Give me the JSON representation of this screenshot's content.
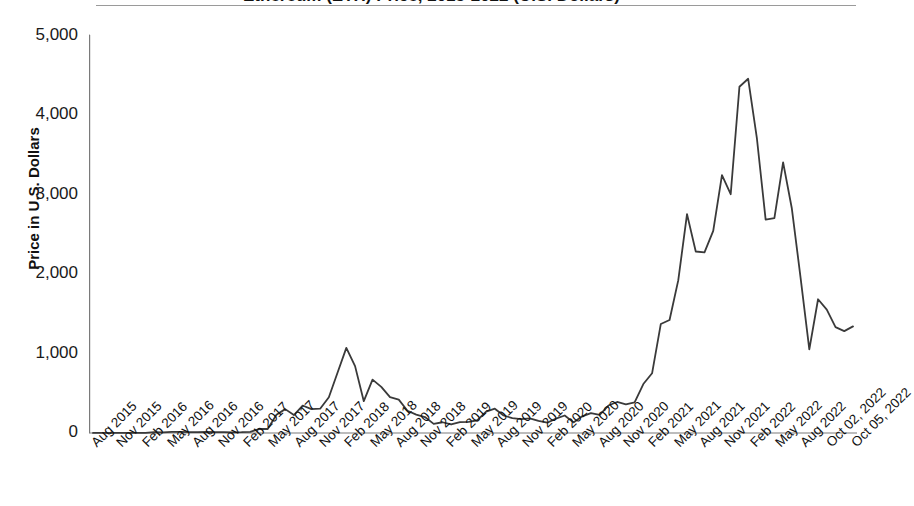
{
  "title": "Ethereum (ETH) Price, 2015-2022 (U.S. Dollars)",
  "axes": {
    "ylabel": "Price in U.S. Dollars",
    "yticks": [
      "5,000",
      "4,000",
      "3,000",
      "2,000",
      "1,000",
      "0"
    ],
    "ytick_values": [
      5000,
      4000,
      3000,
      2000,
      1000,
      0
    ]
  },
  "chart_data": {
    "type": "line",
    "title": "Ethereum (ETH) Price, 2015-2022 (U.S. Dollars)",
    "xlabel": "",
    "ylabel": "Price in U.S. Dollars",
    "ylim": [
      0,
      5000
    ],
    "grid": false,
    "legend": "none",
    "line_color": "#3a3a3a",
    "x_tick_labels": [
      "Aug 2015",
      "Nov 2015",
      "Feb 2016",
      "May 2016",
      "Aug 2016",
      "Nov 2016",
      "Feb 2017",
      "May 2017",
      "Aug 2017",
      "Nov 2017",
      "Feb 2018",
      "May 2018",
      "Aug 2018",
      "Nov 2018",
      "Feb 2019",
      "May 2019",
      "Aug 2019",
      "Nov 2019",
      "Feb 2020",
      "May 2020",
      "Aug 2020",
      "Nov 2020",
      "Feb 2021",
      "May 2021",
      "Aug 2021",
      "Nov 2021",
      "Feb 2022",
      "May 2022",
      "Aug 2022",
      "Oct 02, 2022",
      "Oct 05, 2022"
    ],
    "x": [
      "Aug 2015",
      "Sep 2015",
      "Oct 2015",
      "Nov 2015",
      "Dec 2015",
      "Jan 2016",
      "Feb 2016",
      "Mar 2016",
      "Apr 2016",
      "May 2016",
      "Jun 2016",
      "Jul 2016",
      "Aug 2016",
      "Sep 2016",
      "Oct 2016",
      "Nov 2016",
      "Dec 2016",
      "Jan 2017",
      "Feb 2017",
      "Mar 2017",
      "Apr 2017",
      "May 2017",
      "Jun 2017",
      "Jul 2017",
      "Aug 2017",
      "Sep 2017",
      "Oct 2017",
      "Nov 2017",
      "Dec 2017",
      "Jan 2018",
      "Feb 2018",
      "Mar 2018",
      "Apr 2018",
      "May 2018",
      "Jun 2018",
      "Jul 2018",
      "Aug 2018",
      "Sep 2018",
      "Oct 2018",
      "Nov 2018",
      "Dec 2018",
      "Jan 2019",
      "Feb 2019",
      "Mar 2019",
      "Apr 2019",
      "May 2019",
      "Jun 2019",
      "Jul 2019",
      "Aug 2019",
      "Sep 2019",
      "Oct 2019",
      "Nov 2019",
      "Dec 2019",
      "Jan 2020",
      "Feb 2020",
      "Mar 2020",
      "Apr 2020",
      "May 2020",
      "Jun 2020",
      "Jul 2020",
      "Aug 2020",
      "Sep 2020",
      "Oct 2020",
      "Nov 2020",
      "Dec 2020",
      "Jan 2021",
      "Feb 2021",
      "Mar 2021",
      "Apr 2021",
      "May 2021",
      "Jun 2021",
      "Jul 2021",
      "Aug 2021",
      "Sep 2021",
      "Oct 2021",
      "Nov 2021",
      "Dec 2021",
      "Jan 2022",
      "Feb 2022",
      "Mar 2022",
      "Apr 2022",
      "May 2022",
      "Jun 2022",
      "Jul 2022",
      "Aug 2022",
      "Sep 2022",
      "Oct 02, 2022",
      "Oct 05, 2022"
    ],
    "values": [
      1,
      1,
      1,
      1,
      1,
      1,
      2,
      11,
      8,
      14,
      13,
      12,
      11,
      13,
      12,
      10,
      8,
      10,
      15,
      50,
      50,
      230,
      300,
      225,
      345,
      300,
      305,
      450,
      760,
      1070,
      840,
      400,
      670,
      580,
      450,
      420,
      280,
      230,
      200,
      115,
      135,
      107,
      136,
      141,
      160,
      268,
      305,
      220,
      187,
      175,
      183,
      151,
      129,
      180,
      220,
      133,
      210,
      250,
      228,
      345,
      390,
      360,
      385,
      615,
      750,
      1370,
      1420,
      1920,
      2750,
      2280,
      2270,
      2540,
      3240,
      3000,
      4350,
      4450,
      3700,
      2680,
      2700,
      3400,
      2820,
      1950,
      1050,
      1680,
      1550,
      1330,
      1280,
      1340
    ],
    "notable_points": [
      {
        "label": "2018 bubble peak",
        "x": "Jan 2018",
        "y": 1070
      },
      {
        "label": "all-time high",
        "x": "Nov 2021",
        "y": 4450
      },
      {
        "label": "2022 low",
        "x": "Jun 2022",
        "y": 1050
      },
      {
        "label": "final value",
        "x": "Oct 05, 2022",
        "y": 1340
      }
    ]
  }
}
